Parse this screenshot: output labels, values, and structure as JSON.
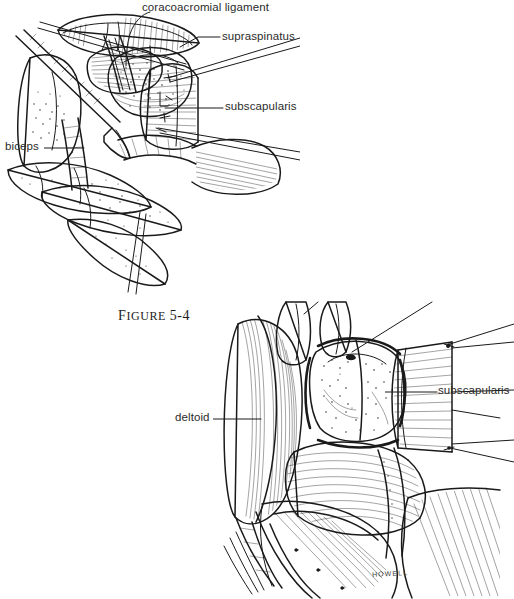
{
  "page": {
    "background_color": "#ffffff",
    "ink_color": "#1a1a1a",
    "text_color": "#2b2b2b",
    "width": 514,
    "height": 599
  },
  "figure_top": {
    "name": "shoulder-open-exposure-superior-view",
    "caption": "FIGURE 5-4",
    "caption_prefix": "F",
    "caption_rest": "IGURE",
    "caption_number": "5-4",
    "labels": [
      {
        "id": "coracoacromial-ligament",
        "text": "coracoacromial ligament",
        "x": 142,
        "y": 3
      },
      {
        "id": "supraspinatus",
        "text": "supraspinatus",
        "x": 222,
        "y": 31
      },
      {
        "id": "subscapularis",
        "text": "subscapularis",
        "x": 225,
        "y": 101
      },
      {
        "id": "biceps",
        "text": "biceps",
        "x": 5,
        "y": 141
      }
    ]
  },
  "figure_bottom": {
    "name": "deltopectoral-approach-subscapularis-takedown",
    "labels": [
      {
        "id": "subscapularis",
        "text": "subscapularis",
        "x": 438,
        "y": 385
      },
      {
        "id": "deltoid",
        "text": "deltoid",
        "x": 175,
        "y": 412
      }
    ],
    "signature": "HOWELL"
  }
}
